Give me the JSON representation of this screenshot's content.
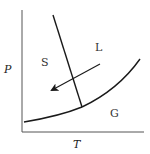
{
  "diagram": {
    "title": "",
    "type": "phase-diagram",
    "axes": {
      "x_label": "T",
      "y_label": "P"
    },
    "regions": [
      {
        "id": "solid",
        "label": "S"
      },
      {
        "id": "liquid",
        "label": "L"
      },
      {
        "id": "gas",
        "label": "G"
      }
    ],
    "curves": [
      {
        "id": "fusion-curve",
        "description": "solid-liquid boundary, negative slope"
      },
      {
        "id": "vaporization-curve",
        "description": "liquid-gas boundary"
      },
      {
        "id": "sublimation-curve",
        "description": "solid-gas boundary"
      }
    ],
    "arrow": {
      "description": "path from liquid region into solid region, pointing down-left"
    },
    "colors": {
      "line": "#1a1a1a",
      "text": "#333333",
      "background": "#ffffff"
    }
  }
}
